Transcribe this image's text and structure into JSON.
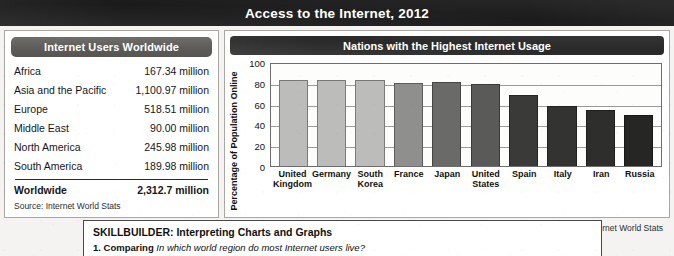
{
  "banner": {
    "title": "Access to the Internet, 2012"
  },
  "table": {
    "header": "Internet Users Worldwide",
    "rows": [
      {
        "region": "Africa",
        "value": "167.34 million"
      },
      {
        "region": "Asia and the Pacific",
        "value": "1,100.97 million"
      },
      {
        "region": "Europe",
        "value": "518.51 million"
      },
      {
        "region": "Middle East",
        "value": "90.00 million"
      },
      {
        "region": "North America",
        "value": "245.98 million"
      },
      {
        "region": "South America",
        "value": "189.98 million"
      }
    ],
    "total": {
      "region": "Worldwide",
      "value": "2,312.7 million"
    },
    "source": "Source: Internet World Stats"
  },
  "chart_panel": {
    "header": "Nations with the Highest Internet Usage",
    "source": "Source: Internet World Stats"
  },
  "chart_data": {
    "type": "bar",
    "title": "Nations with the Highest Internet Usage",
    "xlabel": "",
    "ylabel": "Percentage of Population Online",
    "ylim": [
      0,
      100
    ],
    "yticks": [
      0,
      20,
      40,
      60,
      80,
      100
    ],
    "grid": true,
    "legend": false,
    "categories": [
      "United Kingdom",
      "Germany",
      "South Korea",
      "France",
      "Japan",
      "United States",
      "Spain",
      "Italy",
      "Iran",
      "Russia"
    ],
    "values": [
      83,
      83,
      83,
      80,
      81,
      79,
      68,
      58,
      54,
      49
    ],
    "bar_colors": [
      "#bcbcba",
      "#bcbcba",
      "#bcbcba",
      "#8f8f8d",
      "#6a6a68",
      "#5a5a58",
      "#3a3a38",
      "#333331",
      "#2e2e2c",
      "#262624"
    ]
  },
  "skillbuilder": {
    "title": "SKILLBUILDER: Interpreting Charts and Graphs",
    "question_number": "1.",
    "question_verb": "Comparing",
    "question_text": "In which world region do most Internet users live?"
  },
  "colors": {
    "banner_bg": "#1b1b1b",
    "table_header_bg": "#5d5c59",
    "chart_header_bg": "#2a2a2a",
    "page_bg": "#f4f3f1"
  }
}
